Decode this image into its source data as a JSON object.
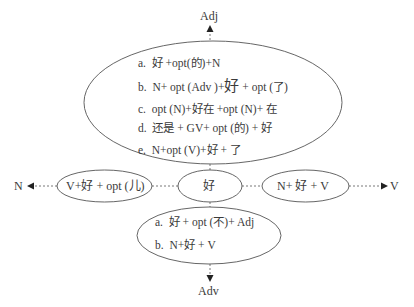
{
  "diagram": {
    "axes": {
      "top": "Adj",
      "bottom": "Adv",
      "left": "N",
      "right": "V"
    },
    "center_node": "好",
    "top_node": {
      "items": [
        {
          "marker": "a.",
          "text": "好 +opt(的)+N"
        },
        {
          "marker": "b.",
          "text_pre": "N+ opt (Adv )+",
          "text_big": "好",
          "text_post": " + opt (了)"
        },
        {
          "marker": "c.",
          "text": "opt (N)+好在 +opt (N)+ 在"
        },
        {
          "marker": "d.",
          "text": "还是 + GV+  opt (的) + 好"
        },
        {
          "marker": "e.",
          "text": "N+opt (V)+好 + 了"
        }
      ]
    },
    "left_node": "V+好 + opt (儿)",
    "right_node": "N+  好 + V",
    "bottom_node": {
      "items": [
        {
          "marker": "a.",
          "text": "好 + opt (不)+ Adj"
        },
        {
          "marker": "b.",
          "text": "N+好 + V"
        }
      ]
    },
    "colors": {
      "line": "#555555",
      "text": "#3a3a3a",
      "background": "#ffffff"
    }
  }
}
